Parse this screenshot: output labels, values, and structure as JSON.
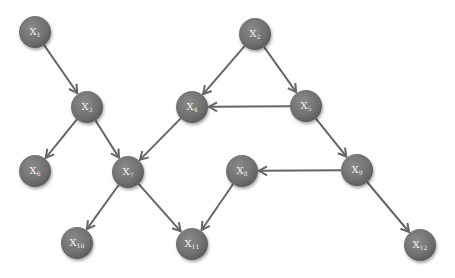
{
  "diagram": {
    "type": "directed-graph",
    "colors": {
      "node": "#6e6e6e",
      "node_light": "#8a8a8a",
      "node_dark": "#555555",
      "edge": "#666666",
      "label": "#f2f2f2"
    },
    "node_radius": 16,
    "nodes": [
      {
        "id": "X1",
        "base": "X",
        "sub": "1",
        "x": 35,
        "y": 32
      },
      {
        "id": "X2",
        "base": "X",
        "sub": "2",
        "x": 255,
        "y": 34
      },
      {
        "id": "X3",
        "base": "X",
        "sub": "3",
        "x": 87,
        "y": 107
      },
      {
        "id": "X4",
        "base": "X",
        "sub": "4",
        "x": 192,
        "y": 107
      },
      {
        "id": "X5",
        "base": "X",
        "sub": "5",
        "x": 306,
        "y": 106
      },
      {
        "id": "X6",
        "base": "X",
        "sub": "6",
        "x": 35,
        "y": 171
      },
      {
        "id": "X7",
        "base": "X",
        "sub": "7",
        "x": 128,
        "y": 172
      },
      {
        "id": "X8",
        "base": "X",
        "sub": "8",
        "x": 242,
        "y": 171
      },
      {
        "id": "X9",
        "base": "X",
        "sub": "9",
        "x": 357,
        "y": 170
      },
      {
        "id": "X10",
        "base": "X",
        "sub": "10",
        "x": 77,
        "y": 243
      },
      {
        "id": "X11",
        "base": "X",
        "sub": "11",
        "x": 192,
        "y": 244
      },
      {
        "id": "X12",
        "base": "X",
        "sub": "12",
        "x": 420,
        "y": 245
      }
    ],
    "edges": [
      {
        "from": "X1",
        "to": "X3"
      },
      {
        "from": "X2",
        "to": "X4"
      },
      {
        "from": "X2",
        "to": "X5"
      },
      {
        "from": "X5",
        "to": "X4"
      },
      {
        "from": "X3",
        "to": "X6"
      },
      {
        "from": "X3",
        "to": "X7"
      },
      {
        "from": "X4",
        "to": "X7"
      },
      {
        "from": "X5",
        "to": "X9"
      },
      {
        "from": "X9",
        "to": "X8"
      },
      {
        "from": "X9",
        "to": "X12"
      },
      {
        "from": "X7",
        "to": "X10"
      },
      {
        "from": "X7",
        "to": "X11"
      },
      {
        "from": "X8",
        "to": "X11"
      }
    ]
  }
}
